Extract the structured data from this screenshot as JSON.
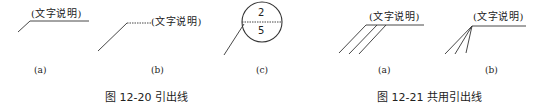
{
  "figure_12_20": {
    "caption": "图 12-20   引出线",
    "panels": [
      {
        "id": "a",
        "label": "(a)",
        "note": "(文字说明)"
      },
      {
        "id": "b",
        "label": "(b)",
        "note": "(文字说明)"
      },
      {
        "id": "c",
        "label": "(c)",
        "upper": "2",
        "lower": "5"
      }
    ]
  },
  "figure_12_21": {
    "caption": "图 12-21   共用引出线",
    "panels": [
      {
        "id": "a",
        "label": "(a)",
        "note": "(文字说明)"
      },
      {
        "id": "b",
        "label": "(b)",
        "note": "(文字说明)"
      }
    ]
  },
  "colors": {
    "line": "#333333",
    "text": "#222222",
    "background": "#ffffff"
  }
}
